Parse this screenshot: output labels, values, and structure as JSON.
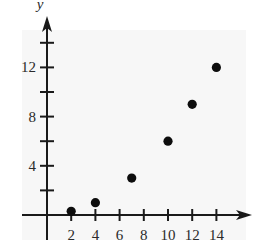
{
  "chart_data": {
    "type": "scatter",
    "title": "",
    "xlabel": "",
    "ylabel": "y",
    "xlim": [
      -1,
      16
    ],
    "ylim": [
      -1,
      15
    ],
    "grid": false,
    "legend": null,
    "x_ticks": [
      2,
      4,
      6,
      8,
      10,
      12,
      14
    ],
    "x_tick_labels": [
      "2",
      "4",
      "6",
      "8",
      "10",
      "12",
      "14"
    ],
    "y_ticks": [
      2,
      4,
      6,
      8,
      10,
      12,
      14
    ],
    "y_tick_labels": [
      "",
      "4",
      "",
      "8",
      "",
      "12",
      ""
    ],
    "series": [
      {
        "name": "points",
        "points": [
          {
            "x": 2,
            "y": 0.3
          },
          {
            "x": 4,
            "y": 1
          },
          {
            "x": 7,
            "y": 3
          },
          {
            "x": 10,
            "y": 6
          },
          {
            "x": 12,
            "y": 9
          },
          {
            "x": 14,
            "y": 12
          }
        ]
      }
    ],
    "colors": {
      "axis": "#1a1a1a",
      "marker": "#0d0d0d",
      "plot_background": "#f7f7f7"
    }
  }
}
